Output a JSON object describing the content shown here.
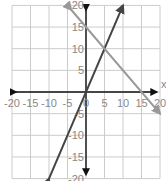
{
  "chart_data": {
    "type": "line",
    "title": "",
    "xlabel": "x",
    "ylabel": "",
    "xlim": [
      -20,
      20
    ],
    "ylim": [
      -20,
      20
    ],
    "grid": true,
    "x_ticks": [
      -20,
      -15,
      -10,
      -5,
      0,
      5,
      10,
      15,
      20
    ],
    "y_ticks": [
      20,
      15,
      10,
      5,
      0,
      -5,
      -10,
      -15,
      -20
    ],
    "x_tick_labels": [
      "-20",
      "-15",
      "-10",
      "-5",
      "0",
      "5",
      "10",
      "15",
      "20"
    ],
    "y_tick_labels": [
      "20",
      "15",
      "10",
      "5",
      "0",
      "-5",
      "-10",
      "-15",
      "-20"
    ],
    "series": [
      {
        "name": "y = 2x",
        "color": "#444444",
        "arrows": "both",
        "x": [
          -10,
          10
        ],
        "y": [
          -20,
          20
        ]
      },
      {
        "name": "y = -x + 15",
        "color": "#999999",
        "arrows": "both",
        "x": [
          -4,
          20
        ],
        "y": [
          19,
          -5
        ]
      }
    ],
    "annotations": [
      {
        "text": "intersection",
        "x": 5,
        "y": 10
      }
    ]
  },
  "axes": {
    "x_axis_label": "x",
    "axis_color": "#111111",
    "grid_color": "#cccccc"
  }
}
